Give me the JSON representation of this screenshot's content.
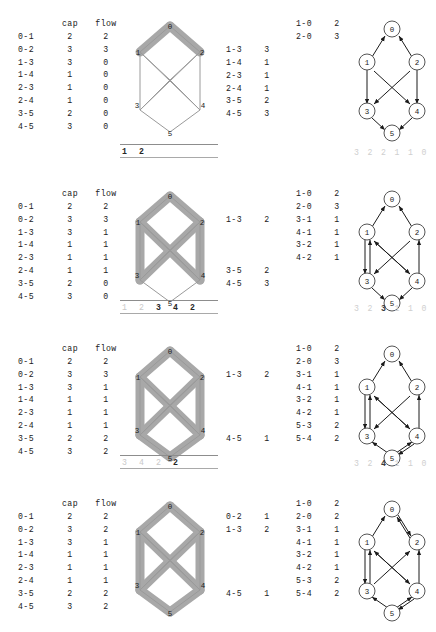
{
  "figure": {
    "columns": {
      "edge": "",
      "cap": "cap",
      "flow": "flow"
    },
    "node_labels": [
      "0",
      "1",
      "2",
      "3",
      "4",
      "5"
    ],
    "colors": {
      "highlight": "#a8a8a8",
      "network_outline": "#9a9a9a",
      "node_stroke": "#555555",
      "text": "#1b1b1b",
      "dim_text": "#cfcfcf"
    }
  },
  "panels": [
    {
      "name": "iteration-1",
      "cap_flow_table": {
        "header": {
          "edge": "",
          "cap": "cap",
          "flow": "flow"
        },
        "rows": [
          {
            "edge": "0-1",
            "cap": "2",
            "flow": "2"
          },
          {
            "edge": "0-2",
            "cap": "3",
            "flow": "3"
          },
          {
            "edge": "1-3",
            "cap": "3",
            "flow": "0"
          },
          {
            "edge": "1-4",
            "cap": "1",
            "flow": "0"
          },
          {
            "edge": "2-3",
            "cap": "1",
            "flow": "0"
          },
          {
            "edge": "2-4",
            "cap": "1",
            "flow": "0"
          },
          {
            "edge": "3-5",
            "cap": "2",
            "flow": "0"
          },
          {
            "edge": "4-5",
            "cap": "3",
            "flow": "0"
          }
        ]
      },
      "residual_left": [
        {
          "edge": "",
          "value": ""
        },
        {
          "edge": "",
          "value": ""
        },
        {
          "edge": "1-3",
          "value": "3"
        },
        {
          "edge": "1-4",
          "value": "1"
        },
        {
          "edge": "2-3",
          "value": "1"
        },
        {
          "edge": "2-4",
          "value": "1"
        },
        {
          "edge": "3-5",
          "value": "2"
        },
        {
          "edge": "4-5",
          "value": "3"
        }
      ],
      "residual_right": [
        {
          "edge": "1-0",
          "value": "2"
        },
        {
          "edge": "2-0",
          "value": "3"
        },
        {
          "edge": "",
          "value": ""
        },
        {
          "edge": "",
          "value": ""
        },
        {
          "edge": "",
          "value": ""
        },
        {
          "edge": "",
          "value": ""
        },
        {
          "edge": "",
          "value": ""
        },
        {
          "edge": "",
          "value": ""
        }
      ],
      "queue": [
        {
          "text": "1",
          "tone": "dark"
        },
        {
          "text": "2",
          "tone": "dark"
        }
      ],
      "residual_caption": [
        {
          "text": "3",
          "tone": "dim"
        },
        {
          "text": "2",
          "tone": "dim"
        },
        {
          "text": "2",
          "tone": "dim"
        },
        {
          "text": "1",
          "tone": "dim"
        },
        {
          "text": "1",
          "tone": "dim"
        },
        {
          "text": "0",
          "tone": "dim"
        }
      ],
      "highlighted_edges": [
        "0-1",
        "0-2"
      ],
      "residual_edges": [
        "1-0",
        "2-0",
        "1-3",
        "1-4",
        "2-3",
        "2-4",
        "3-5",
        "4-5"
      ]
    },
    {
      "name": "iteration-2",
      "cap_flow_table": {
        "header": {
          "edge": "",
          "cap": "cap",
          "flow": "flow"
        },
        "rows": [
          {
            "edge": "0-1",
            "cap": "2",
            "flow": "2"
          },
          {
            "edge": "0-2",
            "cap": "3",
            "flow": "3"
          },
          {
            "edge": "1-3",
            "cap": "3",
            "flow": "1"
          },
          {
            "edge": "1-4",
            "cap": "1",
            "flow": "1"
          },
          {
            "edge": "2-3",
            "cap": "1",
            "flow": "1"
          },
          {
            "edge": "2-4",
            "cap": "1",
            "flow": "1"
          },
          {
            "edge": "3-5",
            "cap": "2",
            "flow": "0"
          },
          {
            "edge": "4-5",
            "cap": "3",
            "flow": "0"
          }
        ]
      },
      "residual_left": [
        {
          "edge": "",
          "value": ""
        },
        {
          "edge": "",
          "value": ""
        },
        {
          "edge": "1-3",
          "value": "2"
        },
        {
          "edge": "",
          "value": ""
        },
        {
          "edge": "",
          "value": ""
        },
        {
          "edge": "",
          "value": ""
        },
        {
          "edge": "3-5",
          "value": "2"
        },
        {
          "edge": "4-5",
          "value": "3"
        }
      ],
      "residual_right": [
        {
          "edge": "1-0",
          "value": "2"
        },
        {
          "edge": "2-0",
          "value": "3"
        },
        {
          "edge": "3-1",
          "value": "1"
        },
        {
          "edge": "4-1",
          "value": "1"
        },
        {
          "edge": "3-2",
          "value": "1"
        },
        {
          "edge": "4-2",
          "value": "1"
        },
        {
          "edge": "",
          "value": ""
        },
        {
          "edge": "",
          "value": ""
        }
      ],
      "queue": [
        {
          "text": "1",
          "tone": "dim"
        },
        {
          "text": "2",
          "tone": "dim"
        },
        {
          "text": "3",
          "tone": "dark"
        },
        {
          "text": "4",
          "tone": "dark"
        },
        {
          "text": "2",
          "tone": "dark"
        }
      ],
      "residual_caption": [
        {
          "text": "3",
          "tone": "dim"
        },
        {
          "text": "2",
          "tone": "dim"
        },
        {
          "text": "3",
          "tone": "dark"
        },
        {
          "text": "1",
          "tone": "dim"
        },
        {
          "text": "1",
          "tone": "dim"
        },
        {
          "text": "0",
          "tone": "dim"
        }
      ],
      "highlighted_edges": [
        "0-1",
        "0-2",
        "1-3",
        "1-4",
        "2-3",
        "2-4"
      ],
      "residual_edges": [
        "1-0",
        "2-0",
        "3-1",
        "4-1",
        "3-2",
        "4-2",
        "1-3",
        "3-5",
        "4-5"
      ]
    },
    {
      "name": "iteration-3",
      "cap_flow_table": {
        "header": {
          "edge": "",
          "cap": "cap",
          "flow": "flow"
        },
        "rows": [
          {
            "edge": "0-1",
            "cap": "2",
            "flow": "2"
          },
          {
            "edge": "0-2",
            "cap": "3",
            "flow": "3"
          },
          {
            "edge": "1-3",
            "cap": "3",
            "flow": "1"
          },
          {
            "edge": "1-4",
            "cap": "1",
            "flow": "1"
          },
          {
            "edge": "2-3",
            "cap": "1",
            "flow": "1"
          },
          {
            "edge": "2-4",
            "cap": "1",
            "flow": "1"
          },
          {
            "edge": "3-5",
            "cap": "2",
            "flow": "2"
          },
          {
            "edge": "4-5",
            "cap": "3",
            "flow": "2"
          }
        ]
      },
      "residual_left": [
        {
          "edge": "",
          "value": ""
        },
        {
          "edge": "",
          "value": ""
        },
        {
          "edge": "1-3",
          "value": "2"
        },
        {
          "edge": "",
          "value": ""
        },
        {
          "edge": "",
          "value": ""
        },
        {
          "edge": "",
          "value": ""
        },
        {
          "edge": "",
          "value": ""
        },
        {
          "edge": "4-5",
          "value": "1"
        }
      ],
      "residual_right": [
        {
          "edge": "1-0",
          "value": "2"
        },
        {
          "edge": "2-0",
          "value": "3"
        },
        {
          "edge": "3-1",
          "value": "1"
        },
        {
          "edge": "4-1",
          "value": "1"
        },
        {
          "edge": "3-2",
          "value": "1"
        },
        {
          "edge": "4-2",
          "value": "1"
        },
        {
          "edge": "5-3",
          "value": "2"
        },
        {
          "edge": "5-4",
          "value": "2"
        }
      ],
      "queue": [
        {
          "text": "3",
          "tone": "dim"
        },
        {
          "text": "4",
          "tone": "dim"
        },
        {
          "text": "2",
          "tone": "dim"
        },
        {
          "text": "2",
          "tone": "dark"
        }
      ],
      "residual_caption": [
        {
          "text": "3",
          "tone": "dim"
        },
        {
          "text": "2",
          "tone": "dim"
        },
        {
          "text": "4",
          "tone": "dark"
        },
        {
          "text": "1",
          "tone": "dim"
        },
        {
          "text": "1",
          "tone": "dim"
        },
        {
          "text": "0",
          "tone": "dim"
        }
      ],
      "highlighted_edges": [
        "0-1",
        "0-2",
        "1-3",
        "1-4",
        "2-3",
        "2-4",
        "3-5",
        "4-5"
      ],
      "residual_edges": [
        "1-0",
        "2-0",
        "3-1",
        "4-1",
        "3-2",
        "4-2",
        "5-3",
        "5-4",
        "1-3",
        "4-5"
      ]
    },
    {
      "name": "iteration-4",
      "cap_flow_table": {
        "header": {
          "edge": "",
          "cap": "cap",
          "flow": "flow"
        },
        "rows": [
          {
            "edge": "0-1",
            "cap": "2",
            "flow": "2"
          },
          {
            "edge": "0-2",
            "cap": "3",
            "flow": "2"
          },
          {
            "edge": "1-3",
            "cap": "3",
            "flow": "1"
          },
          {
            "edge": "1-4",
            "cap": "1",
            "flow": "1"
          },
          {
            "edge": "2-3",
            "cap": "1",
            "flow": "1"
          },
          {
            "edge": "2-4",
            "cap": "1",
            "flow": "1"
          },
          {
            "edge": "3-5",
            "cap": "2",
            "flow": "2"
          },
          {
            "edge": "4-5",
            "cap": "3",
            "flow": "2"
          }
        ]
      },
      "residual_left": [
        {
          "edge": "",
          "value": ""
        },
        {
          "edge": "0-2",
          "value": "1"
        },
        {
          "edge": "1-3",
          "value": "2"
        },
        {
          "edge": "",
          "value": ""
        },
        {
          "edge": "",
          "value": ""
        },
        {
          "edge": "",
          "value": ""
        },
        {
          "edge": "",
          "value": ""
        },
        {
          "edge": "4-5",
          "value": "1"
        }
      ],
      "residual_right": [
        {
          "edge": "1-0",
          "value": "2"
        },
        {
          "edge": "2-0",
          "value": "2"
        },
        {
          "edge": "3-1",
          "value": "1"
        },
        {
          "edge": "4-1",
          "value": "1"
        },
        {
          "edge": "3-2",
          "value": "1"
        },
        {
          "edge": "4-2",
          "value": "1"
        },
        {
          "edge": "5-3",
          "value": "2"
        },
        {
          "edge": "5-4",
          "value": "2"
        }
      ],
      "queue": [],
      "residual_caption": [],
      "highlighted_edges": [
        "0-1",
        "0-2",
        "1-3",
        "1-4",
        "2-3",
        "2-4",
        "3-5",
        "4-5"
      ],
      "residual_edges": [
        "1-0",
        "2-0",
        "3-1",
        "4-1",
        "3-2",
        "4-2",
        "5-3",
        "5-4",
        "0-2",
        "1-3",
        "4-5"
      ]
    }
  ]
}
